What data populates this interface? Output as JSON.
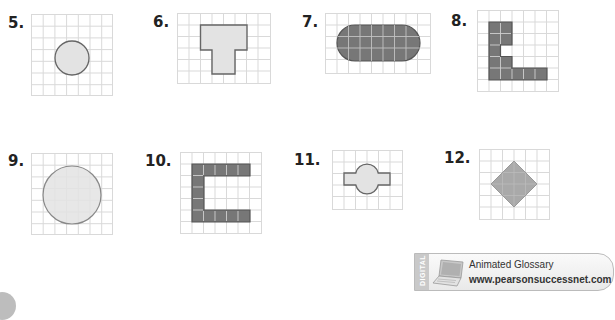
{
  "problems": [
    {
      "number": "5.",
      "shape": "circle",
      "grid": {
        "cols": 7,
        "rows": 7
      },
      "fill": "light-gray"
    },
    {
      "number": "6.",
      "shape": "t-shape",
      "grid": {
        "cols": 8,
        "rows": 6
      },
      "fill": "light-gray"
    },
    {
      "number": "7.",
      "shape": "stadium",
      "grid": {
        "cols": 9,
        "rows": 5
      },
      "fill": "dark-gray"
    },
    {
      "number": "8.",
      "shape": "l-shape",
      "grid": {
        "cols": 7,
        "rows": 7
      },
      "fill": "dark-gray"
    },
    {
      "number": "9.",
      "shape": "circle",
      "grid": {
        "cols": 7,
        "rows": 7
      },
      "fill": "light-gray"
    },
    {
      "number": "10.",
      "shape": "c-shape",
      "grid": {
        "cols": 7,
        "rows": 7
      },
      "fill": "dark-gray"
    },
    {
      "number": "11.",
      "shape": "cross-bulge",
      "grid": {
        "cols": 6,
        "rows": 5
      },
      "fill": "light-gray"
    },
    {
      "number": "12.",
      "shape": "diamond",
      "grid": {
        "cols": 6,
        "rows": 6
      },
      "fill": "medium-gray"
    }
  ],
  "glossary": {
    "tab_label": "DIGITAL",
    "title": "Animated Glossary",
    "url": "www.pearsonsuccessnet.com"
  },
  "colors": {
    "grid_line": "#d9d9d9",
    "light_fill": "#e3e3e3",
    "dark_fill": "#777777",
    "medium_fill": "#a9a9a9",
    "outline": "#666666"
  }
}
